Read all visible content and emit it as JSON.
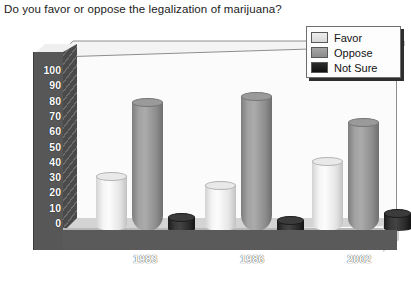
{
  "title": "Do you favor or oppose the legalization of marijuana?",
  "legend": {
    "items": [
      {
        "label": "Favor",
        "color": "#e9e9e9",
        "icon": "legend-swatch-icon"
      },
      {
        "label": "Oppose",
        "color": "#9a9a9a",
        "icon": "legend-swatch-icon"
      },
      {
        "label": "Not Sure",
        "color": "#2c2c2c",
        "icon": "legend-swatch-icon"
      }
    ]
  },
  "axis": {
    "y_ticks": [
      "100",
      "90",
      "80",
      "70",
      "60",
      "50",
      "40",
      "30",
      "20",
      "10",
      "0"
    ],
    "x_ticks": [
      "1983",
      "1986",
      "2002"
    ]
  },
  "chart_data": {
    "type": "bar",
    "title": "Do you favor or oppose the legalization of marijuana?",
    "xlabel": "",
    "ylabel": "",
    "ylim": [
      0,
      100
    ],
    "ytick_step": 10,
    "grid": false,
    "legend_position": "top-right",
    "style": "3d-cylinder",
    "categories": [
      "1983",
      "1986",
      "2002"
    ],
    "series": [
      {
        "name": "Favor",
        "color": "#e9e9e9",
        "values": [
          36,
          30,
          46
        ]
      },
      {
        "name": "Oppose",
        "color": "#9a9a9a",
        "values": [
          84,
          88,
          71
        ]
      },
      {
        "name": "Not Sure",
        "color": "#2c2c2c",
        "values": [
          9,
          7,
          12
        ]
      }
    ]
  }
}
